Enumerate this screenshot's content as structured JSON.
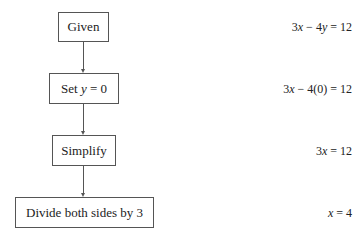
{
  "diagram": {
    "type": "flowchart",
    "steps": [
      {
        "label": "Given",
        "equation": "3x − 4y = 12"
      },
      {
        "label": "Set y = 0",
        "equation": "3x − 4(0) = 12"
      },
      {
        "label": "Simplify",
        "equation": "3x = 12"
      },
      {
        "label": "Divide both sides by 3",
        "equation": "x = 4"
      }
    ]
  }
}
